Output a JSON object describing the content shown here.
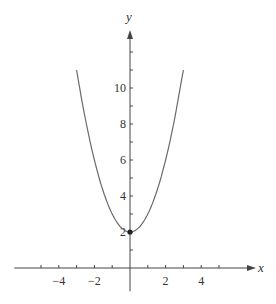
{
  "chart_data": {
    "type": "line",
    "title": "",
    "xlabel": "x",
    "ylabel": "y",
    "function": "y = x^2 + 2",
    "xlim": [
      -6.5,
      6.8
    ],
    "ylim": [
      -1.3,
      13.2
    ],
    "x_ticks": [
      -5,
      -4,
      -3,
      -2,
      -1,
      1,
      2,
      3,
      4,
      5
    ],
    "x_tick_labels": [
      {
        "value": -4,
        "label": "−4"
      },
      {
        "value": -2,
        "label": "−2"
      },
      {
        "value": 2,
        "label": "2"
      },
      {
        "value": 4,
        "label": "4"
      }
    ],
    "y_ticks": [
      1,
      2,
      3,
      4,
      5,
      6,
      7,
      8,
      9,
      10,
      11,
      12
    ],
    "y_tick_labels": [
      {
        "value": 2,
        "label": "2"
      },
      {
        "value": 4,
        "label": "4"
      },
      {
        "value": 6,
        "label": "6"
      },
      {
        "value": 8,
        "label": "8"
      },
      {
        "value": 10,
        "label": "10"
      }
    ],
    "series": [
      {
        "name": "parabola",
        "x": [
          -3,
          -2.5,
          -2,
          -1.5,
          -1,
          -0.5,
          0,
          0.5,
          1,
          1.5,
          2,
          2.5,
          3
        ],
        "y": [
          11,
          8.25,
          6,
          4.25,
          3,
          2.25,
          2,
          2.25,
          3,
          4.25,
          6,
          8.25,
          11
        ]
      }
    ],
    "points": [
      {
        "x": 0,
        "y": 2,
        "label": "vertex"
      }
    ],
    "grid": false,
    "legend": null
  },
  "colors": {
    "axis": "#444444",
    "curve": "#6a6a6a",
    "point": "#222222"
  }
}
